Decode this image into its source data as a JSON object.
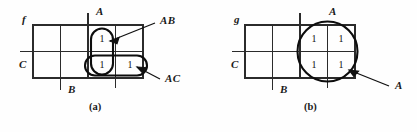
{
  "figure": {
    "type": "karnaugh-map-pair"
  },
  "panel_a": {
    "caption": "(a)",
    "function_label": "f",
    "axis_labels": {
      "top": "A",
      "left": "C",
      "bottom": "B"
    },
    "grid": {
      "cols": 4,
      "rows": 2
    },
    "cells": [
      {
        "row": 0,
        "col": 0,
        "value": ""
      },
      {
        "row": 0,
        "col": 1,
        "value": ""
      },
      {
        "row": 0,
        "col": 2,
        "value": "1"
      },
      {
        "row": 0,
        "col": 3,
        "value": ""
      },
      {
        "row": 1,
        "col": 0,
        "value": ""
      },
      {
        "row": 1,
        "col": 1,
        "value": ""
      },
      {
        "row": 1,
        "col": 2,
        "value": "1"
      },
      {
        "row": 1,
        "col": 3,
        "value": "1"
      }
    ],
    "groups": [
      {
        "name": "AB",
        "label": "AB",
        "shape": "vertical-oval",
        "covers": "column 3, rows 1-2"
      },
      {
        "name": "AC",
        "label": "AC",
        "shape": "horizontal-oval",
        "covers": "row 2, columns 3-4"
      }
    ]
  },
  "panel_b": {
    "caption": "(b)",
    "function_label": "g",
    "axis_labels": {
      "top": "A",
      "left": "C",
      "bottom": "B"
    },
    "grid": {
      "cols": 4,
      "rows": 2
    },
    "cells": [
      {
        "row": 0,
        "col": 0,
        "value": ""
      },
      {
        "row": 0,
        "col": 1,
        "value": ""
      },
      {
        "row": 0,
        "col": 2,
        "value": "1"
      },
      {
        "row": 0,
        "col": 3,
        "value": "1"
      },
      {
        "row": 1,
        "col": 0,
        "value": ""
      },
      {
        "row": 1,
        "col": 1,
        "value": ""
      },
      {
        "row": 1,
        "col": 2,
        "value": "1"
      },
      {
        "row": 1,
        "col": 3,
        "value": "1"
      }
    ],
    "groups": [
      {
        "name": "A",
        "label": "A",
        "shape": "circle",
        "covers": "columns 3-4, rows 1-2"
      }
    ]
  },
  "colors": {
    "ink": "#1a1a1a",
    "grid": "#2b2b2b",
    "loop": "#0d0d0d",
    "background": "#fefefe"
  }
}
